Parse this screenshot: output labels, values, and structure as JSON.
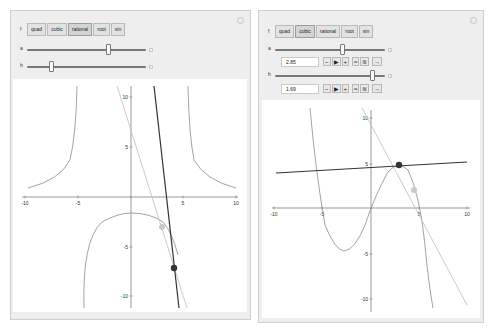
{
  "left_panel": {
    "function_label": "f",
    "tabs": [
      {
        "label": "quad",
        "selected": false
      },
      {
        "label": "cubic",
        "selected": false
      },
      {
        "label": "rational",
        "selected": true
      },
      {
        "label": "root",
        "selected": false
      },
      {
        "label": "sin",
        "selected": false
      }
    ],
    "sliders": [
      {
        "label": "a",
        "position_pct": 76
      },
      {
        "label": "h",
        "position_pct": 20
      }
    ],
    "plot": {
      "x_ticks": [
        "-10",
        "-5",
        "5",
        "10"
      ],
      "y_ticks": [
        "10",
        "5",
        "-5",
        "-10"
      ]
    }
  },
  "right_panel": {
    "function_label": "f",
    "tabs": [
      {
        "label": "quad",
        "selected": false
      },
      {
        "label": "cubic",
        "selected": true
      },
      {
        "label": "rational",
        "selected": false
      },
      {
        "label": "root",
        "selected": false
      },
      {
        "label": "sin",
        "selected": false
      }
    ],
    "sliders": [
      {
        "label": "a",
        "position_pct": 64,
        "value": "2.85"
      },
      {
        "label": "h",
        "position_pct": 88,
        "value": "1.69"
      }
    ],
    "animator_buttons": [
      "−",
      "▶",
      "+",
      "≈",
      "≋",
      "→"
    ],
    "plot": {
      "x_ticks": [
        "-10",
        "-5",
        "5",
        "10"
      ],
      "y_ticks": [
        "10",
        "5",
        "-5",
        "-10"
      ]
    }
  },
  "colors": {
    "panel_bg": "#eeeeee",
    "curve": "#8a8a8a",
    "secant": "#c4c4c4",
    "tangent": "#333333",
    "point_dark": "#333333",
    "point_light": "#c8c8c8"
  }
}
